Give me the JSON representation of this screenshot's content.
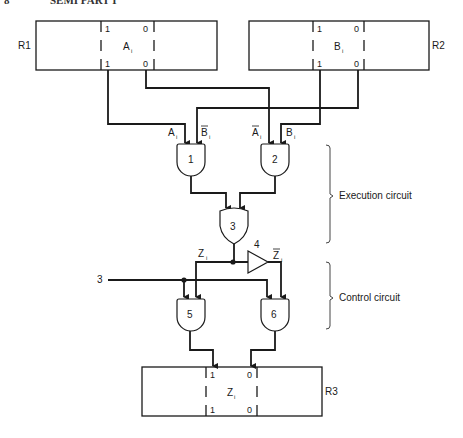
{
  "header": {
    "number": "8",
    "title": "SEMI PART I"
  },
  "registers": [
    {
      "name": "R1",
      "bit": "A",
      "sub": "i",
      "top_left": "1",
      "top_right": "0",
      "bottom_left": "1",
      "bottom_right": "0"
    },
    {
      "name": "R2",
      "bit": "B",
      "sub": "i",
      "top_left": "1",
      "top_right": "0",
      "bottom_left": "1",
      "bottom_right": "0"
    },
    {
      "name": "R3",
      "bit": "Z",
      "sub": "i",
      "top_left": "1",
      "top_right": "0",
      "bottom_left": "1",
      "bottom_right": "0"
    }
  ],
  "signals": {
    "a": "A",
    "a_sub": "i",
    "b_bar": "B",
    "b_bar_sub": "i",
    "a_bar": "A",
    "a_bar_sub": "i",
    "b": "B",
    "b_sub": "i",
    "z": "Z",
    "z_sub": "i",
    "z_bar": "Z",
    "z_bar_sub": "i",
    "control_input": "3"
  },
  "gates": [
    {
      "id": "1",
      "type": "AND"
    },
    {
      "id": "2",
      "type": "AND"
    },
    {
      "id": "3",
      "type": "OR"
    },
    {
      "id": "4",
      "type": "NOT"
    },
    {
      "id": "5",
      "type": "AND"
    },
    {
      "id": "6",
      "type": "AND"
    }
  ],
  "brackets": {
    "execution": "Execution circuit",
    "control": "Control circuit"
  }
}
